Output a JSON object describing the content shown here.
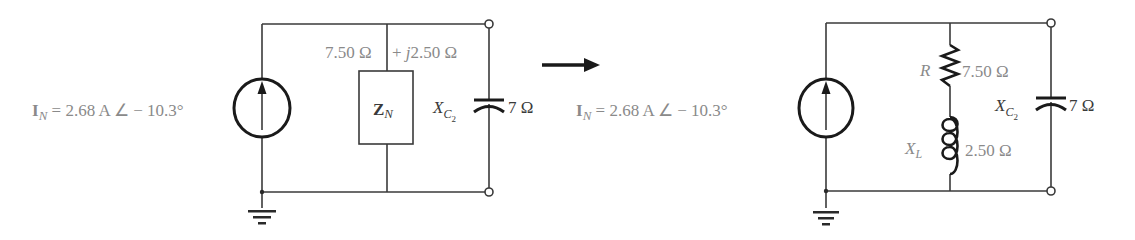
{
  "figure": {
    "left_circuit": {
      "source": {
        "symbol": "I",
        "subscript": "N",
        "value_text": " = 2.68 A ∠ − 10.3°"
      },
      "impedance_label": {
        "real_part": "7.50 Ω",
        "imag_part": "+ ",
        "j": "j",
        "imag_value": "2.50 Ω"
      },
      "impedance_box": {
        "symbol": "Z",
        "subscript": "N"
      },
      "capacitor": {
        "symbol": "X",
        "subscript": "C",
        "sub_subscript": "2",
        "value": "7 Ω"
      }
    },
    "transform_arrow": {
      "icon": "right-arrow-icon"
    },
    "right_circuit": {
      "source": {
        "symbol": "I",
        "subscript": "N",
        "value_text": " = 2.68 A ∠ − 10.3°"
      },
      "resistor": {
        "symbol": "R",
        "value": "7.50 Ω"
      },
      "inductor": {
        "symbol": "X",
        "subscript": "L",
        "value": "2.50 Ω"
      },
      "capacitor": {
        "symbol": "X",
        "subscript": "C",
        "sub_subscript": "2",
        "value": "7 Ω"
      }
    },
    "colors": {
      "wire": "#3a3a3a",
      "label": "#8a8a8a",
      "background": "#ffffff"
    }
  }
}
